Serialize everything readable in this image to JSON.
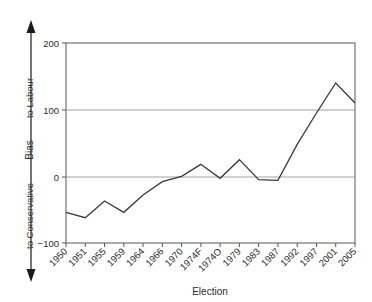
{
  "chart_data": {
    "type": "line",
    "title": "",
    "xlabel": "Election",
    "ylabel": "Bias",
    "categories": [
      "1950",
      "1951",
      "1955",
      "1959",
      "1964",
      "1966",
      "1970",
      "1974F",
      "1974O",
      "1979",
      "1983",
      "1987",
      "1992",
      "1997",
      "2001",
      "2005"
    ],
    "values": [
      -54,
      -62,
      -37,
      -54,
      -28,
      -8,
      0,
      18,
      -3,
      25,
      -5,
      -6,
      48,
      95,
      140,
      110
    ],
    "series": [
      {
        "name": "Bias",
        "values": [
          -54,
          -62,
          -37,
          -54,
          -28,
          -8,
          0,
          18,
          -3,
          25,
          -5,
          -6,
          48,
          95,
          140,
          110
        ]
      }
    ],
    "ylim": [
      -100,
      200
    ],
    "yticks": [
      -100,
      0,
      100,
      200
    ],
    "ytick_labels": [
      "−100",
      "0",
      "100",
      "200"
    ],
    "grid": "horizontal",
    "legend": "none",
    "annotations": {
      "y_direction_top": "to Labour",
      "y_direction_bottom": "to Conservative",
      "arrow_top": "▲",
      "arrow_bottom": "▼"
    },
    "line_color": "#3a3a3a",
    "grid_color": "#8c8c8c",
    "axis_color": "#565656"
  },
  "axes": {
    "y_title": "Bias",
    "x_title": "Election",
    "y_tick_labels": [
      "200",
      "100",
      "0",
      "−100"
    ],
    "x_tick_labels": [
      "1950",
      "1951",
      "1955",
      "1959",
      "1964",
      "1966",
      "1970",
      "1974F",
      "1974O",
      "1979",
      "1983",
      "1987",
      "1992",
      "1997",
      "2001",
      "2005"
    ],
    "direction_upper": "to Labour",
    "direction_lower": "to Conservative"
  }
}
